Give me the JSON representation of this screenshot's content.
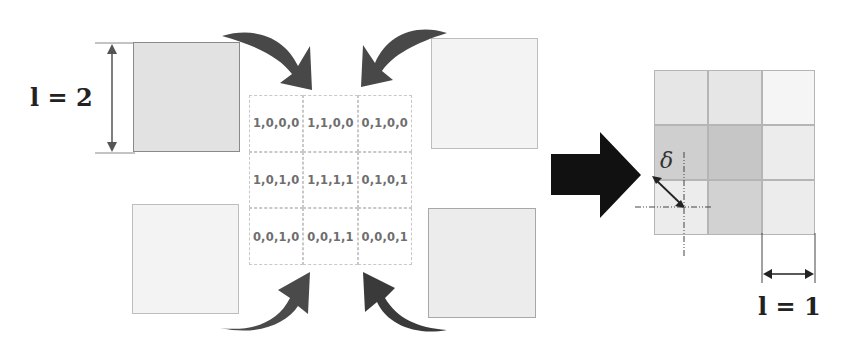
{
  "left_label": {
    "text": "l = 2"
  },
  "right_label": {
    "text": "l = 1"
  },
  "delta_label": {
    "text": "δ"
  },
  "grid": {
    "rows": [
      [
        {
          "digits": [
            "1",
            "0",
            "0",
            "0"
          ]
        },
        {
          "digits": [
            "1",
            "1",
            "0",
            "0"
          ]
        },
        {
          "digits": [
            "0",
            "1",
            "0",
            "0"
          ]
        }
      ],
      [
        {
          "digits": [
            "1",
            "0",
            "1",
            "0"
          ]
        },
        {
          "digits": [
            "1",
            "1",
            "1",
            "1"
          ]
        },
        {
          "digits": [
            "0",
            "1",
            "0",
            "1"
          ]
        }
      ],
      [
        {
          "digits": [
            "0",
            "0",
            "1",
            "0"
          ]
        },
        {
          "digits": [
            "0",
            "0",
            "1",
            "1"
          ]
        },
        {
          "digits": [
            "0",
            "0",
            "0",
            "1"
          ]
        }
      ]
    ],
    "labels": [
      [
        "1,0,0,0",
        "1,1,0,0",
        "0,1,0,0"
      ],
      [
        "1,0,1,0",
        "1,1,1,1",
        "0,1,0,1"
      ],
      [
        "0,0,1,0",
        "0,0,1,1",
        "0,0,0,1"
      ]
    ]
  },
  "colors": {
    "arrow_curved": "#4a4a4a",
    "arrow_big": "#111111",
    "square_top_left": "#e2e2e2",
    "square_faint": "#f3f3f3",
    "result_dark": "#cfcfcf",
    "result_light": "#ececec"
  },
  "result_grid": {
    "shades": [
      [
        "#e6e6e6",
        "#e6e6e6",
        "#f5f5f5"
      ],
      [
        "#cfcfcf",
        "#c8c8c8",
        "#ececec"
      ],
      [
        "#ececec",
        "#d2d2d2",
        "#ececec"
      ]
    ]
  }
}
